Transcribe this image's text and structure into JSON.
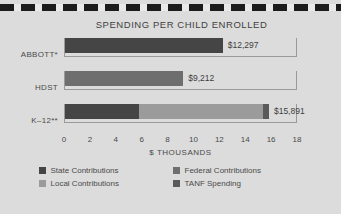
{
  "chart_data": {
    "type": "bar",
    "orientation": "horizontal",
    "stacked": true,
    "title": "SPENDING PER CHILD ENROLLED",
    "xlabel": "$ THOUSANDS",
    "ylabel": "",
    "xlim": [
      0,
      18
    ],
    "xticks": [
      0,
      2,
      4,
      6,
      8,
      10,
      12,
      14,
      16,
      18
    ],
    "xtick_labels": [
      "0",
      "2",
      "4",
      "6",
      "8",
      "10",
      "12",
      "14",
      "16",
      "18"
    ],
    "grid": false,
    "legend_position": "bottom",
    "categories": [
      "ABBOTT*",
      "HDST",
      "K–12**"
    ],
    "series": [
      {
        "name": "State Contributions",
        "color": "#454545",
        "values": [
          12.297,
          0,
          5.8
        ]
      },
      {
        "name": "Federal Contributions",
        "color": "#6e6e6e",
        "values": [
          0,
          9.212,
          0
        ]
      },
      {
        "name": "Local Contributions",
        "color": "#9b9b9b",
        "values": [
          0,
          0,
          9.65
        ]
      },
      {
        "name": "TANF Spending",
        "color": "#5a5a5a",
        "values": [
          0,
          0,
          0.441
        ]
      }
    ],
    "bars": [
      {
        "category": "ABBOTT*",
        "total": 12.297,
        "value_label": "$12,297",
        "segments": [
          {
            "series": "State Contributions",
            "value": 12.297,
            "color": "#454545"
          }
        ]
      },
      {
        "category": "HDST",
        "total": 9.212,
        "value_label": "$9,212",
        "segments": [
          {
            "series": "Federal Contributions",
            "value": 9.212,
            "color": "#6e6e6e"
          }
        ]
      },
      {
        "category": "K–12**",
        "total": 15.891,
        "value_label": "$15,891",
        "segments": [
          {
            "series": "State Contributions",
            "value": 5.8,
            "color": "#454545"
          },
          {
            "series": "Local Contributions",
            "value": 9.65,
            "color": "#9b9b9b"
          },
          {
            "series": "TANF Spending",
            "value": 0.441,
            "color": "#5a5a5a"
          }
        ]
      }
    ],
    "legend": [
      {
        "label": "State Contributions",
        "color": "#454545"
      },
      {
        "label": "Federal Contributions",
        "color": "#6e6e6e"
      },
      {
        "label": "Local Contributions",
        "color": "#9b9b9b"
      },
      {
        "label": "TANF Spending",
        "color": "#5a5a5a"
      }
    ],
    "colors": {
      "background": "#dcdcdc",
      "text": "#4a4a4a",
      "axis_line": "#9a9a9a",
      "rule": "#1c1c1c"
    }
  }
}
